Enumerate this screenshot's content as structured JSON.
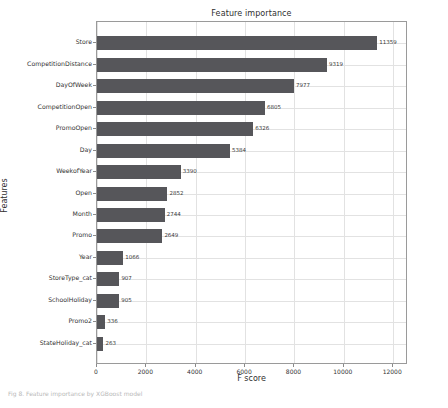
{
  "chart_data": {
    "type": "bar",
    "orientation": "horizontal",
    "title": "Feature importance",
    "xlabel": "F score",
    "ylabel": "Features",
    "categories": [
      "Store",
      "CompetitionDistance",
      "DayOfWeek",
      "CompetitionOpen",
      "PromoOpen",
      "Day",
      "WeekofYear",
      "Open",
      "Month",
      "Promo",
      "Year",
      "StoreType_cat",
      "SchoolHoliday",
      "Promo2",
      "StateHoliday_cat"
    ],
    "values": [
      11359,
      9319,
      7977,
      6805,
      6326,
      5384,
      3390,
      2852,
      2744,
      2649,
      1066,
      907,
      905,
      336,
      263
    ],
    "xlim": [
      0,
      12600
    ],
    "xticks": [
      0,
      2000,
      4000,
      6000,
      8000,
      10000,
      12000
    ],
    "xtick_labels": [
      "0",
      "2000",
      "4000",
      "6000",
      "8000",
      "10000",
      "12000"
    ],
    "grid": true,
    "legend": false,
    "bar_color": "#56565a"
  },
  "caption": {
    "text": "Fig 8. Feature importance by XGBoost model"
  }
}
